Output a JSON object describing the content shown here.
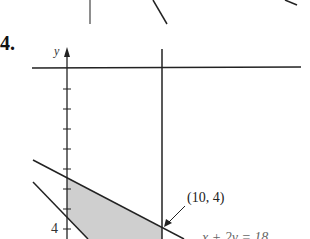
{
  "problem": {
    "number": "4."
  },
  "axes": {
    "y_label": "y",
    "tick_label": "4"
  },
  "annotations": {
    "point": "(10, 4)",
    "equation": "x + 2y = 18"
  },
  "colors": {
    "line": "#1a1a1a",
    "shade": "#cccccc"
  }
}
